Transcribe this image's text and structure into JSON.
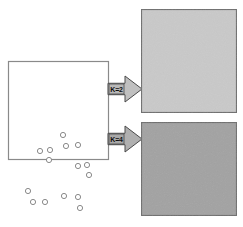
{
  "figure": {
    "type": "clustering-illustration",
    "title_text": "",
    "background_color": "#ffffff"
  },
  "source_panel": {
    "name": "unclustered-data-panel",
    "fill_color": "#ffffff",
    "border_color": "#8a8a8a",
    "x": 8,
    "y": 61,
    "width": 100,
    "height": 98,
    "point_fill": "#ffffff",
    "point_stroke": "#8a8a8a",
    "point_radius": 2.6,
    "points": [
      {
        "x": 55,
        "y": 74
      },
      {
        "x": 58,
        "y": 85
      },
      {
        "x": 70,
        "y": 84
      },
      {
        "x": 32,
        "y": 90
      },
      {
        "x": 42,
        "y": 89
      },
      {
        "x": 41,
        "y": 99
      },
      {
        "x": 70,
        "y": 105
      },
      {
        "x": 79,
        "y": 104
      },
      {
        "x": 81,
        "y": 114
      },
      {
        "x": 20,
        "y": 130
      },
      {
        "x": 25,
        "y": 141
      },
      {
        "x": 37,
        "y": 141
      },
      {
        "x": 56,
        "y": 135
      },
      {
        "x": 70,
        "y": 136
      },
      {
        "x": 72,
        "y": 147
      }
    ]
  },
  "arrows": [
    {
      "name": "arrow-k2",
      "label": "K=2",
      "fill_color": "#c0c0c0",
      "border_color": "#4a4a4a",
      "label_box_fill": "#b8b8b8",
      "x": 108,
      "y": 76,
      "width": 34,
      "height": 26
    },
    {
      "name": "arrow-k4",
      "label": "K=4",
      "fill_color": "#b0b0b0",
      "border_color": "#4a4a4a",
      "label_box_fill": "#a8a8a8",
      "x": 108,
      "y": 126,
      "width": 34,
      "height": 26
    }
  ],
  "result_panels": [
    {
      "name": "k2-result-panel",
      "caption": "K=2",
      "fill_color": "#c9c9c9",
      "border_color": "#6e6e6e",
      "x": 141,
      "y": 9,
      "width": 95,
      "height": 103,
      "point_fill": "#ffffff",
      "point_stroke": "#5a5a5a",
      "point_radius": 2.7,
      "cluster_stroke": "#3c3c3c",
      "clusters": [
        {
          "name": "cluster-1",
          "shape": "ellipse",
          "cx": 190,
          "cy": 46,
          "rx": 37,
          "ry": 21,
          "rotation": -36,
          "points": [
            {
              "x": 188,
              "y": 22
            },
            {
              "x": 196,
              "y": 32
            },
            {
              "x": 207,
              "y": 32
            },
            {
              "x": 170,
              "y": 37
            },
            {
              "x": 181,
              "y": 37
            },
            {
              "x": 178,
              "y": 47
            },
            {
              "x": 205,
              "y": 54
            },
            {
              "x": 216,
              "y": 53
            },
            {
              "x": 218,
              "y": 63
            }
          ]
        },
        {
          "name": "cluster-2",
          "shape": "ellipse",
          "cx": 187,
          "cy": 88,
          "rx": 37,
          "ry": 13,
          "rotation": -4,
          "points": [
            {
              "x": 160,
              "y": 82
            },
            {
              "x": 163,
              "y": 93
            },
            {
              "x": 176,
              "y": 93
            },
            {
              "x": 198,
              "y": 86
            },
            {
              "x": 210,
              "y": 86
            },
            {
              "x": 209,
              "y": 97
            }
          ]
        }
      ]
    },
    {
      "name": "k4-result-panel",
      "caption": "K=4",
      "fill_color": "#a2a2a2",
      "border_color": "#6e6e6e",
      "x": 141,
      "y": 122,
      "width": 95,
      "height": 93,
      "point_fill": "#ffffff",
      "point_stroke": "#4a4a4a",
      "point_radius": 2.7,
      "cluster_stroke": "#2e2e2e",
      "clusters": [
        {
          "name": "cluster-1",
          "shape": "ellipse",
          "cx": 180,
          "cy": 148,
          "rx": 27,
          "ry": 16,
          "rotation": -30,
          "points": [
            {
              "x": 186,
              "y": 131
            },
            {
              "x": 183,
              "y": 143
            },
            {
              "x": 196,
              "y": 144
            },
            {
              "x": 166,
              "y": 147
            },
            {
              "x": 175,
              "y": 147
            },
            {
              "x": 172,
              "y": 157
            }
          ]
        },
        {
          "name": "cluster-2",
          "shape": "circle",
          "cx": 212,
          "cy": 166,
          "rx": 16,
          "ry": 15,
          "rotation": 0,
          "points": [
            {
              "x": 205,
              "y": 161
            },
            {
              "x": 218,
              "y": 160
            },
            {
              "x": 217,
              "y": 172
            }
          ]
        },
        {
          "name": "cluster-3",
          "shape": "circle",
          "cx": 167,
          "cy": 189,
          "rx": 16,
          "ry": 15,
          "rotation": 0,
          "points": [
            {
              "x": 162,
              "y": 181
            },
            {
              "x": 160,
              "y": 194
            },
            {
              "x": 173,
              "y": 194
            }
          ]
        },
        {
          "name": "cluster-4",
          "shape": "circle",
          "cx": 208,
          "cy": 193,
          "rx": 18,
          "ry": 17,
          "rotation": 0,
          "points": [
            {
              "x": 200,
              "y": 188
            },
            {
              "x": 212,
              "y": 188
            },
            {
              "x": 209,
              "y": 201
            }
          ]
        }
      ]
    }
  ]
}
